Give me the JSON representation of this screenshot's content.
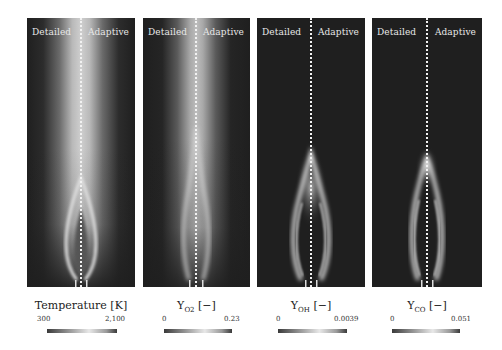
{
  "figure": {
    "panels": [
      {
        "id": "temperature",
        "left_label": "Detailed",
        "right_label": "Adaptive",
        "caption_main": "Temperature [K]",
        "caption_sub": "",
        "caption_unit": "",
        "colorbar": {
          "min": "300",
          "max": "2,100"
        }
      },
      {
        "id": "yo2",
        "left_label": "Detailed",
        "right_label": "Adaptive",
        "caption_main": "Y",
        "caption_sub": "O2",
        "caption_unit": " [−]",
        "colorbar": {
          "min": "0",
          "max": "0.23"
        }
      },
      {
        "id": "yoh",
        "left_label": "Detailed",
        "right_label": "Adaptive",
        "caption_main": "Y",
        "caption_sub": "OH",
        "caption_unit": " [−]",
        "colorbar": {
          "min": "0",
          "max": "0.0039"
        }
      },
      {
        "id": "yco",
        "left_label": "Detailed",
        "right_label": "Adaptive",
        "caption_main": "Y",
        "caption_sub": "CO",
        "caption_unit": " [−]",
        "colorbar": {
          "min": "0",
          "max": "0.051"
        }
      }
    ],
    "colors": {
      "panel_background": "#1f1f1f",
      "field_high": "#e6e6e6",
      "divider": "#f2f2f2"
    }
  }
}
